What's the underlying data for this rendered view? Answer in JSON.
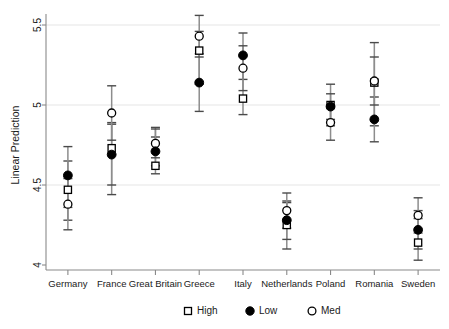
{
  "chart_data": {
    "type": "scatter",
    "title": "",
    "xlabel": "",
    "ylabel": "Linear Prediction",
    "ylim": [
      4,
      5.5
    ],
    "yticks": [
      4,
      4.5,
      5,
      5.5
    ],
    "ytick_labels": [
      "4",
      "4.5",
      "5",
      "5.5"
    ],
    "grid": true,
    "legend_position": "bottom",
    "categories": [
      "Germany",
      "France",
      "Great Britain",
      "Greece",
      "Italy",
      "Netherlands",
      "Poland",
      "Romania",
      "Sweden"
    ],
    "series": [
      {
        "name": "High",
        "marker": "open-square",
        "values": [
          4.47,
          4.73,
          4.62,
          5.34,
          5.04,
          4.25,
          5.0,
          5.14,
          4.14
        ],
        "ci_low": [
          4.28,
          4.44,
          4.57,
          5.13,
          4.94,
          4.1,
          4.87,
          4.87,
          4.03
        ],
        "ci_high": [
          4.65,
          4.89,
          4.86,
          5.46,
          5.31,
          4.39,
          5.13,
          5.39,
          4.29
        ]
      },
      {
        "name": "Low",
        "marker": "filled-circle",
        "values": [
          4.56,
          4.69,
          4.71,
          5.14,
          5.31,
          4.28,
          4.99,
          4.91,
          4.22
        ],
        "ci_low": [
          4.36,
          4.5,
          4.62,
          4.96,
          5.16,
          4.16,
          4.91,
          4.77,
          4.1
        ],
        "ci_high": [
          4.74,
          4.88,
          4.8,
          5.32,
          5.45,
          4.4,
          5.07,
          5.05,
          4.34
        ]
      },
      {
        "name": "Med",
        "marker": "open-circle",
        "values": [
          4.38,
          4.95,
          4.76,
          5.43,
          5.23,
          4.34,
          4.89,
          5.15,
          4.31
        ],
        "ci_low": [
          4.22,
          4.78,
          4.67,
          5.3,
          5.09,
          4.23,
          4.78,
          5.0,
          4.2
        ],
        "ci_high": [
          4.54,
          5.12,
          4.85,
          5.56,
          5.37,
          4.45,
          5.0,
          5.3,
          4.42
        ]
      }
    ],
    "legend": [
      {
        "label": "High",
        "marker": "open-square"
      },
      {
        "label": "Low",
        "marker": "filled-circle"
      },
      {
        "label": "Med",
        "marker": "open-circle"
      }
    ],
    "colors": {
      "marker_stroke": "#000000",
      "error_bar": "#8d8d8d",
      "axis": "#8a8a8a",
      "grid": "#e2e2e2",
      "background": "#ffffff"
    }
  }
}
